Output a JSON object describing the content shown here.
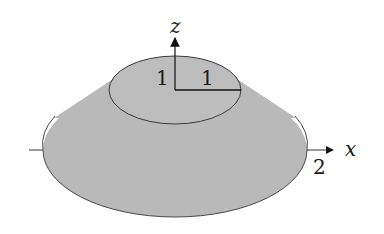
{
  "diagram": {
    "type": "cone-frustum-3d",
    "colors": {
      "fill": "#b9b9b9",
      "stroke": "#4a4a4a",
      "axis": "#111111",
      "background": "#ffffff"
    },
    "axes": {
      "z_label": "z",
      "x_label": "x"
    },
    "labels": {
      "top_height": "1",
      "top_radius": "1",
      "bottom_radius": "2"
    }
  }
}
